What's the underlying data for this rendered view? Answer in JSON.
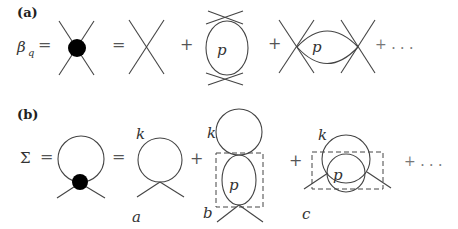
{
  "panels": {
    "a": {
      "label": "(a)",
      "lhs_symbol": "β",
      "lhs_subscript": "q",
      "equals": "=",
      "terms": [
        {
          "type": "vertex-blob"
        },
        {
          "type": "bare-vertex"
        },
        {
          "type": "vertical-bubble",
          "momentum": "p"
        },
        {
          "type": "horizontal-bubble",
          "momentum": "p"
        }
      ],
      "plus": "+",
      "ellipsis": "+ . . ."
    },
    "b": {
      "label": "(b)",
      "lhs_symbol": "Σ",
      "equals": "=",
      "terms": [
        {
          "type": "tadpole-blob"
        },
        {
          "type": "tadpole",
          "loop_momentum": "k",
          "caption": "a"
        },
        {
          "type": "stacked-loops",
          "loop_momentum": "k",
          "inner_momentum": "p",
          "caption": "b"
        },
        {
          "type": "nested-loops",
          "loop_momentum": "k",
          "inner_momentum": "p",
          "caption": "c"
        }
      ],
      "plus": "+",
      "ellipsis": "+ . . ."
    }
  },
  "colors": {
    "line": "#444444",
    "blob": "#000000",
    "background": "#ffffff"
  }
}
